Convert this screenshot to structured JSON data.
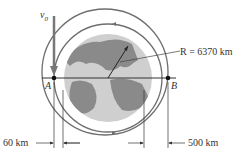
{
  "diagram": {
    "type": "orbital-mechanics",
    "labels": {
      "velocity": "v",
      "velocity_sub": "0",
      "point_a": "A",
      "point_b": "B",
      "radius": "R = 6370 km",
      "altitude_a": "60 km",
      "altitude_b": "500 km"
    },
    "colors": {
      "orbit": "#6e6e6e",
      "earth_land": "#8a8a8a",
      "earth_ocean": "#cfcfcf",
      "line": "#333333",
      "velocity_arrow": "#777777"
    }
  }
}
